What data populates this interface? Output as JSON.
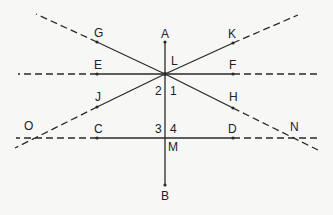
{
  "diagram": {
    "colors": {
      "line": "#2a2a2a",
      "background": "#f7f7f5"
    },
    "points": {
      "A": "A",
      "B": "B",
      "C": "C",
      "D": "D",
      "E": "E",
      "F": "F",
      "G": "G",
      "H": "H",
      "J": "J",
      "K": "K",
      "L": "L",
      "M": "M",
      "N": "N",
      "O": "O"
    },
    "angles": {
      "a1": "1",
      "a2": "2",
      "a3": "3",
      "a4": "4"
    }
  }
}
